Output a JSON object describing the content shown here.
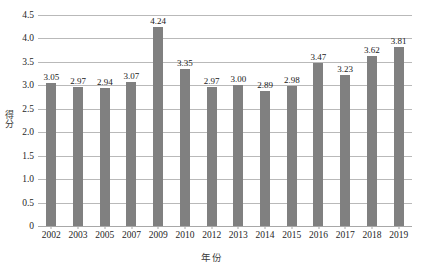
{
  "chart_data": {
    "type": "bar",
    "title": "",
    "xlabel": "年份",
    "ylabel": "得分",
    "categories": [
      "2002",
      "2003",
      "2005",
      "2007",
      "2009",
      "2010",
      "2012",
      "2013",
      "2014",
      "2015",
      "2016",
      "2017",
      "2018",
      "2019"
    ],
    "values": [
      3.05,
      2.97,
      2.94,
      3.07,
      4.24,
      3.35,
      2.97,
      3.0,
      2.89,
      2.98,
      3.47,
      3.23,
      3.62,
      3.81
    ],
    "value_labels": [
      "3.05",
      "2.97",
      "2.94",
      "3.07",
      "4.24",
      "3.35",
      "2.97",
      "3.00",
      "2.89",
      "2.98",
      "3.47",
      "3.23",
      "3.62",
      "3.81"
    ],
    "ylim": [
      0,
      4.5
    ],
    "ytick_values": [
      0,
      0.5,
      1.0,
      1.5,
      2.0,
      2.5,
      3.0,
      3.5,
      4.0,
      4.5
    ],
    "ytick_labels": [
      "0",
      "0.5",
      "1.0",
      "1.5",
      "2.0",
      "2.5",
      "3.0",
      "3.5",
      "4.0",
      "4.5"
    ],
    "grid": "horizontal",
    "legend": "none",
    "series_color": "#808080",
    "gridline_color": "#b9b9b9",
    "show_value_labels": true
  }
}
